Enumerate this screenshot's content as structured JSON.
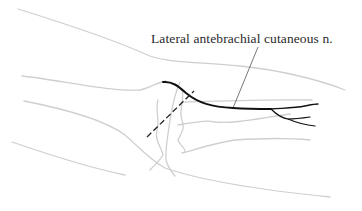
{
  "figure": {
    "labels": [
      {
        "id": "lat-antebrachial-cutaneous",
        "text": "Lateral antebrachial cutaneous n."
      }
    ],
    "colors": {
      "outline": "#c8c8c8",
      "nerve": "#111111",
      "leader": "#555555",
      "dashed_incision": "#222222"
    }
  }
}
